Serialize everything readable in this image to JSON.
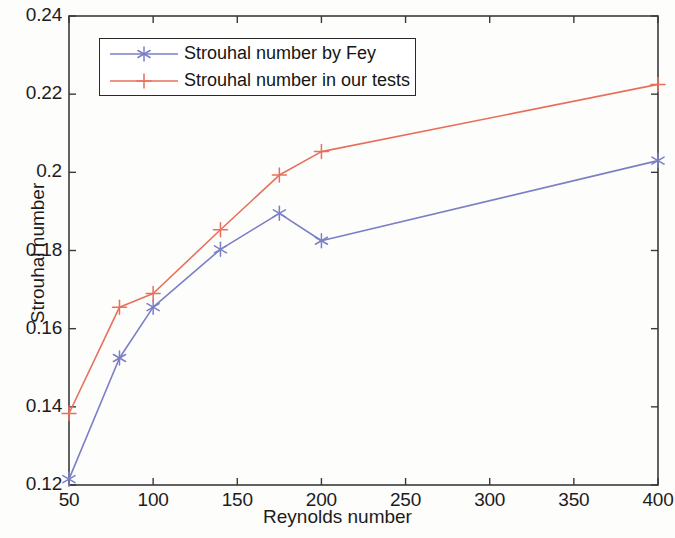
{
  "chart_data": {
    "type": "line",
    "title": "",
    "xlabel": "Reynolds number",
    "ylabel": "Strouhal number",
    "xlim": [
      50,
      400
    ],
    "ylim": [
      0.12,
      0.24
    ],
    "xticks": [
      50,
      100,
      150,
      200,
      250,
      300,
      350,
      400
    ],
    "xtick_labels": [
      "50",
      "100",
      "150",
      "200",
      "250",
      "300",
      "350",
      "400"
    ],
    "yticks": [
      0.12,
      0.14,
      0.16,
      0.18,
      0.2,
      0.22,
      0.24
    ],
    "ytick_labels": [
      "0.12",
      "0.14",
      "0.16",
      "0.18",
      "0.2",
      "0.22",
      "0.24"
    ],
    "grid": false,
    "legend_position": "upper left",
    "x": [
      50,
      80,
      100,
      140,
      175,
      200,
      400
    ],
    "series": [
      {
        "name": "Strouhal number by Fey",
        "color": "#7b7fc4",
        "marker": "asterisk",
        "values": [
          0.1215,
          0.1525,
          0.1655,
          0.1803,
          0.1895,
          0.1825,
          0.203
        ]
      },
      {
        "name": "Strouhal number in our tests",
        "color": "#e8705a",
        "marker": "plus",
        "values": [
          0.1383,
          0.1655,
          0.169,
          0.1853,
          0.1993,
          0.2053,
          0.2225
        ]
      }
    ]
  },
  "axes": {
    "frame_color": "#3a3a3a",
    "background": "#fdfdfc"
  },
  "legend": {
    "entries": [
      {
        "label": "Strouhal number by Fey"
      },
      {
        "label": "Strouhal number in our tests"
      }
    ]
  }
}
